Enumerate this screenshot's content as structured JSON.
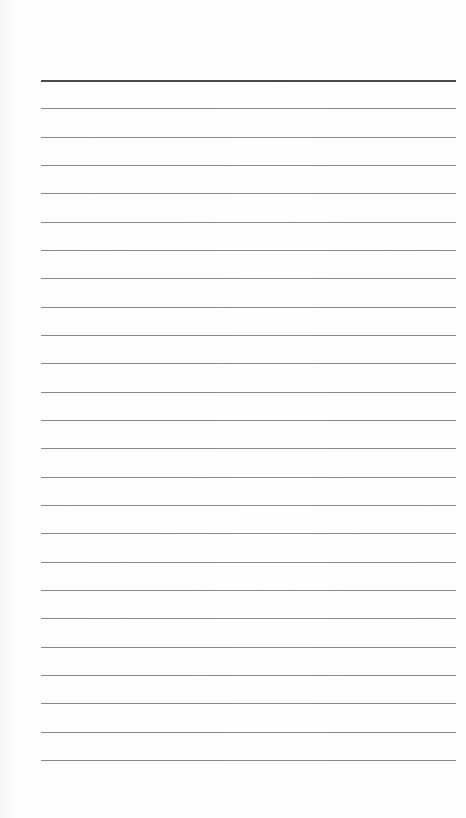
{
  "document": {
    "type": "lined-paper",
    "line_count": 25,
    "first_line_y": 80,
    "line_spacing": 28.33,
    "line_left": 41,
    "line_width": 415,
    "colors": {
      "paper": "#fdfdfd",
      "line": "#8a8a8a",
      "top_line": "#4a4a4a"
    },
    "lines_text": [
      "",
      "",
      "",
      "",
      "",
      "",
      "",
      "",
      "",
      "",
      "",
      "",
      "",
      "",
      "",
      "",
      "",
      "",
      "",
      "",
      "",
      "",
      "",
      "",
      ""
    ]
  }
}
